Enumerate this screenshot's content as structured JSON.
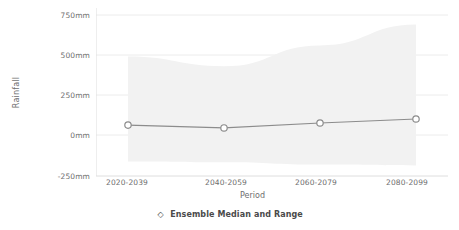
{
  "chart_data": {
    "type": "line",
    "title": "",
    "xlabel": "Period",
    "ylabel": "Rainfall",
    "categories": [
      "2020-2039",
      "2040-2059",
      "2060-2079",
      "2080-2099"
    ],
    "ytick_labels": [
      "750mm",
      "500mm",
      "250mm",
      "0mm",
      "-250mm"
    ],
    "ytick_values": [
      750,
      500,
      250,
      0,
      -250
    ],
    "ylim": [
      -250,
      750
    ],
    "grid": true,
    "grid_axis": "y",
    "legend_position": "bottom",
    "legend": [
      "Ensemble Median and Range"
    ],
    "series": [
      {
        "name": "Ensemble Median and Range",
        "type": "line-with-band",
        "marker": "circle-open",
        "values": [
          62,
          44,
          75,
          100
        ],
        "band_upper": [
          490,
          430,
          560,
          690
        ],
        "band_lower": [
          -165,
          -170,
          -185,
          -190
        ],
        "line_color": "#8c8c8c",
        "marker_color": "#8c8c8c",
        "band_color": "#f2f2f2"
      }
    ]
  },
  "axes": {
    "y_title": "Rainfall",
    "x_title": "Period"
  },
  "legend_item": {
    "label": "Ensemble Median and Range",
    "marker_glyph": "◇"
  },
  "colors": {
    "text": "#6e6e6e",
    "legend_text": "#4a4a4a",
    "line": "#8c8c8c",
    "band": "#f2f2f2",
    "grid": "#ececec",
    "axis": "#d9d9d9",
    "background": "#ffffff"
  }
}
